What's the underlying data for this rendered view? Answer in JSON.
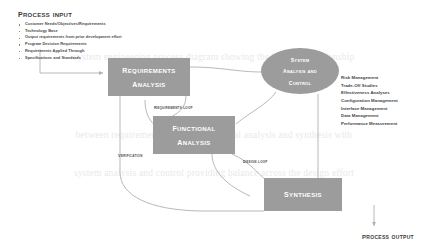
{
  "diagram": {
    "colors": {
      "box_fill": "#9c9c9c",
      "box_text": "#ffffff",
      "connector": "#b0b0b0",
      "body_text": "#3f3f3f",
      "watermark": "#e9e9e9"
    }
  },
  "process_input": {
    "heading": "Process Input",
    "items": [
      "Customer Needs/Objectives/Requirements",
      "Technology Base",
      "Output requirements from prior development effort",
      "Program Decision Requirements",
      "Requirements Applied Through",
      "Specifications and Standards"
    ]
  },
  "boxes": {
    "requirements_analysis": {
      "line1": "Requirements",
      "line2": "Analysis"
    },
    "functional_analysis": {
      "line1": "Functional",
      "line2": "Analysis"
    },
    "synthesis": {
      "line1": "Synthesis"
    },
    "system_analysis_and_control": {
      "line1": "System",
      "line2": "Analysis and",
      "line3": "Control"
    }
  },
  "loop_labels": {
    "requirements_loop": "Requirements loop",
    "verification": "Verification",
    "design_loop": "Design loop"
  },
  "control_list": {
    "items": [
      "Risk Management",
      "Trade-Off Studies",
      "Effectiveness Analyses",
      "Configuration Management",
      "Interface Management",
      "Data Management",
      "Performance Measurement"
    ]
  },
  "process_output": {
    "label": "Process Output"
  },
  "watermark": {
    "lines": [
      "system engineering process diagram showing the iterative relationship",
      "between requirements analysis functional analysis and synthesis with",
      "system analysis and control providing balance across the design effort"
    ]
  }
}
